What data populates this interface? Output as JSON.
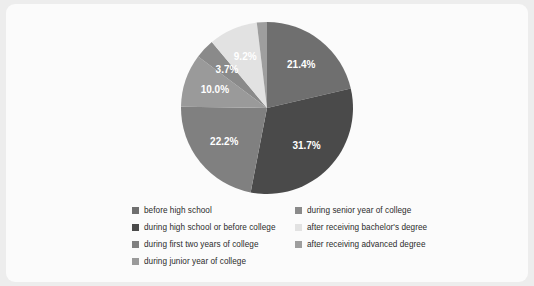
{
  "chart_data": {
    "type": "pie",
    "title": "",
    "categories": [
      "before high school",
      "during high school or before college",
      "during first two years of college",
      "during junior year of college",
      "during senior year of college",
      "after receiving bachelor's degree",
      "after receiving advanced degree"
    ],
    "values": [
      21.4,
      31.7,
      22.2,
      10.0,
      3.7,
      9.2,
      1.9
    ],
    "labels": [
      "21.4%",
      "31.7%",
      "22.2%",
      "10.0%",
      "3.7%",
      "9.2%",
      "1.9%"
    ],
    "colors": [
      "#6f6f6f",
      "#4a4a4a",
      "#808080",
      "#9a9a9a",
      "#8a8a8a",
      "#e2e2e2",
      "#9e9e9e"
    ],
    "unit": "%",
    "start_angle": 0,
    "direction": "clockwise",
    "legend_position": "bottom",
    "grid": false
  },
  "legend": {
    "columns": [
      {
        "items": [
          {
            "label": "before high school",
            "color": "#6f6f6f"
          },
          {
            "label": "during high school or before college",
            "color": "#4a4a4a"
          },
          {
            "label": "during first two years of college",
            "color": "#808080"
          },
          {
            "label": "during junior year of college",
            "color": "#9a9a9a"
          }
        ]
      },
      {
        "items": [
          {
            "label": "during senior year of college",
            "color": "#8a8a8a"
          },
          {
            "label": "after receiving bachelor's degree",
            "color": "#e2e2e2"
          },
          {
            "label": "after receiving advanced degree",
            "color": "#9e9e9e"
          }
        ]
      }
    ]
  },
  "theme": {
    "page_background": "#ededed",
    "card_background": "#fbfbfb",
    "label_text_color": "#2b2b2b"
  }
}
